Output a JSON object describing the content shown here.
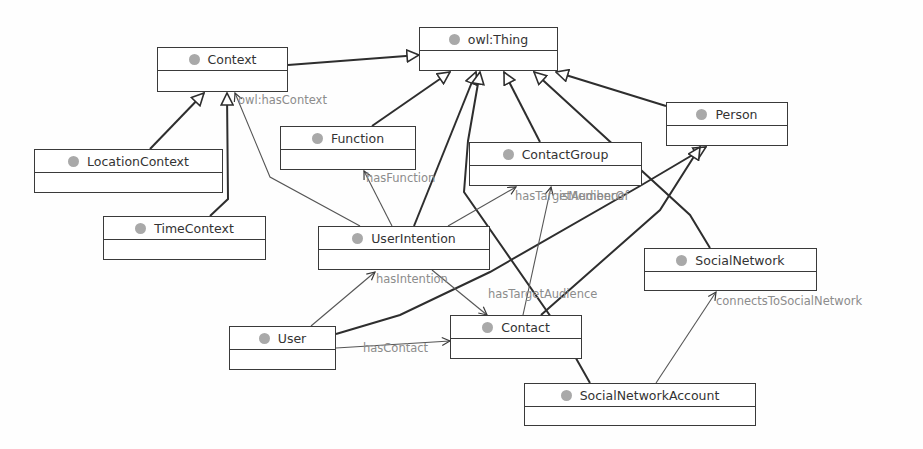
{
  "diagram": {
    "type": "OWL class diagram",
    "classes": [
      {
        "id": "owlThing",
        "label": "owl:Thing",
        "x": 419,
        "y": 27,
        "w": 139,
        "h": 44
      },
      {
        "id": "Context",
        "label": "Context",
        "x": 157,
        "y": 47,
        "w": 131,
        "h": 45
      },
      {
        "id": "Person",
        "label": "Person",
        "x": 666,
        "y": 102,
        "w": 122,
        "h": 44
      },
      {
        "id": "Function",
        "label": "Function",
        "x": 280,
        "y": 126,
        "w": 136,
        "h": 44
      },
      {
        "id": "ContactGroup",
        "label": "ContactGroup",
        "x": 469,
        "y": 142,
        "w": 173,
        "h": 44
      },
      {
        "id": "LocationContext",
        "label": "LocationContext",
        "x": 34,
        "y": 149,
        "w": 189,
        "h": 44
      },
      {
        "id": "TimeContext",
        "label": "TimeContext",
        "x": 103,
        "y": 216,
        "w": 163,
        "h": 44
      },
      {
        "id": "UserIntention",
        "label": "UserIntention",
        "x": 318,
        "y": 226,
        "w": 172,
        "h": 44
      },
      {
        "id": "SocialNetwork",
        "label": "SocialNetwork",
        "x": 644,
        "y": 248,
        "w": 173,
        "h": 43
      },
      {
        "id": "Contact",
        "label": "Contact",
        "x": 450,
        "y": 315,
        "w": 132,
        "h": 44
      },
      {
        "id": "User",
        "label": "User",
        "x": 229,
        "y": 326,
        "w": 107,
        "h": 44
      },
      {
        "id": "SocialNetworkAccount",
        "label": "SocialNetworkAccount",
        "x": 524,
        "y": 383,
        "w": 232,
        "h": 43
      }
    ],
    "property_labels": [
      {
        "id": "hasContext",
        "text": "owl:hasContext",
        "x": 238,
        "y": 100
      },
      {
        "id": "hasFunction",
        "text": "hasFunction",
        "x": 368,
        "y": 178
      },
      {
        "id": "hasTargetAudience1",
        "text": "hasTargetAudience",
        "x": 515,
        "y": 195
      },
      {
        "id": "isMemberOf",
        "text": "isMemberOf",
        "x": 568,
        "y": 195
      },
      {
        "id": "hasIntention",
        "text": "hasIntention",
        "x": 376,
        "y": 279
      },
      {
        "id": "hasTargetAudience2",
        "text": "hasTargetAudience",
        "x": 488,
        "y": 294
      },
      {
        "id": "hasContact",
        "text": "hasContact",
        "x": 363,
        "y": 347
      },
      {
        "id": "connectsToSocialNetwork",
        "text": "connectsToSocialNetwork",
        "x": 717,
        "y": 300
      }
    ],
    "subclass_edges": [
      {
        "from": "Context",
        "to": "owlThing"
      },
      {
        "from": "LocationContext",
        "to": "Context"
      },
      {
        "from": "TimeContext",
        "to": "Context"
      },
      {
        "from": "Function",
        "to": "owlThing"
      },
      {
        "from": "UserIntention",
        "to": "owlThing"
      },
      {
        "from": "ContactGroup",
        "to": "owlThing"
      },
      {
        "from": "SocialNetwork",
        "to": "owlThing"
      },
      {
        "from": "Person",
        "to": "owlThing"
      },
      {
        "from": "User",
        "to": "Person"
      },
      {
        "from": "Contact",
        "to": "Person"
      },
      {
        "from": "SocialNetworkAccount",
        "to": "owlThing"
      }
    ],
    "property_edges": [
      {
        "name": "owl:hasContext",
        "from": "UserIntention",
        "to": "Context"
      },
      {
        "name": "hasFunction",
        "from": "UserIntention",
        "to": "Function"
      },
      {
        "name": "hasTargetAudience",
        "from": "UserIntention",
        "to": "ContactGroup"
      },
      {
        "name": "isMemberOf",
        "from": "Contact",
        "to": "ContactGroup"
      },
      {
        "name": "hasIntention",
        "from": "User",
        "to": "UserIntention"
      },
      {
        "name": "hasTargetAudience",
        "from": "UserIntention",
        "to": "Contact"
      },
      {
        "name": "hasContact",
        "from": "User",
        "to": "Contact"
      },
      {
        "name": "connectsToSocialNetwork",
        "from": "SocialNetworkAccount",
        "to": "SocialNetwork"
      }
    ],
    "colors": {
      "border": "#3a3a3a",
      "class_dot": "#a9a9a9",
      "label_text": "#8c8c8c",
      "class_text": "#333333"
    }
  }
}
